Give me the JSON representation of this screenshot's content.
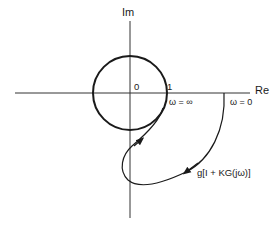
{
  "diagram": {
    "type": "nyquist-plot",
    "axes": {
      "real_label": "Re",
      "imag_label": "Im"
    },
    "unit_circle": {
      "origin_label": "0",
      "radius_label": "1"
    },
    "points": {
      "omega_infinity": "ω = ∞",
      "omega_zero": "ω = 0"
    },
    "curve_label": "g[I + KG(jω)]",
    "colors": {
      "stroke": "#1a1a1a",
      "background": "#ffffff"
    }
  }
}
